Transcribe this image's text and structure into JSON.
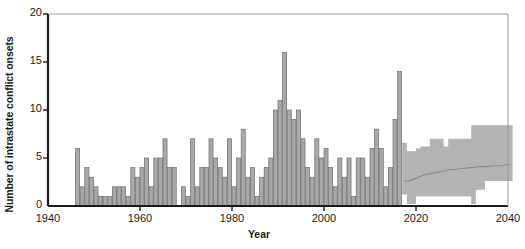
{
  "chart_data": {
    "type": "bar",
    "title": "",
    "xlabel": "Year",
    "ylabel": "Number of intrastate conflict onsets",
    "xlim": [
      1940,
      2040
    ],
    "ylim": [
      0,
      20
    ],
    "xticks": [
      1940,
      1960,
      1980,
      2000,
      2020,
      2040
    ],
    "yticks": [
      0,
      5,
      10,
      15,
      20
    ],
    "grid": false,
    "legend": null,
    "bar_color": "#a8a8a8",
    "bar_edge_color": "#6e6e6e",
    "band_color": "#b3b3b3",
    "median_line_color": "#8a8a8a",
    "axis_color": "#1a1a1a",
    "series": [
      {
        "name": "Observed intrastate conflict onsets",
        "kind": "bar",
        "x": [
          1946,
          1947,
          1948,
          1949,
          1950,
          1951,
          1952,
          1953,
          1954,
          1955,
          1956,
          1957,
          1958,
          1959,
          1960,
          1961,
          1962,
          1963,
          1964,
          1965,
          1966,
          1967,
          1968,
          1969,
          1970,
          1971,
          1972,
          1973,
          1974,
          1975,
          1976,
          1977,
          1978,
          1979,
          1980,
          1981,
          1982,
          1983,
          1984,
          1985,
          1986,
          1987,
          1988,
          1989,
          1990,
          1991,
          1992,
          1993,
          1994,
          1995,
          1996,
          1997,
          1998,
          1999,
          2000,
          2001,
          2002,
          2003,
          2004,
          2005,
          2006,
          2007,
          2008,
          2009,
          2010,
          2011,
          2012,
          2013,
          2014,
          2015,
          2016
        ],
        "values": [
          6,
          2,
          4,
          3,
          2,
          1,
          1,
          1,
          2,
          2,
          2,
          1,
          4,
          3,
          4,
          5,
          2,
          5,
          5,
          7,
          4,
          4,
          0,
          2,
          1,
          7,
          2,
          4,
          4,
          7,
          5,
          4,
          3,
          7,
          2,
          5,
          8,
          3,
          4,
          1,
          3,
          4,
          5,
          10,
          11,
          16,
          10,
          9,
          10,
          7,
          4,
          3,
          7,
          5,
          6,
          4,
          2,
          5,
          3,
          5,
          1,
          5,
          5,
          3,
          6,
          8,
          6,
          2,
          4,
          9,
          14
        ]
      },
      {
        "name": "Forecast median",
        "kind": "line",
        "x": [
          2017,
          2018,
          2019,
          2020,
          2021,
          2022,
          2023,
          2024,
          2025,
          2026,
          2027,
          2028,
          2029,
          2030,
          2031,
          2032,
          2033,
          2034,
          2035,
          2036,
          2037,
          2038,
          2039,
          2040
        ],
        "values": [
          2.6,
          2.6,
          2.8,
          3.0,
          3.2,
          3.3,
          3.4,
          3.5,
          3.6,
          3.7,
          3.8,
          3.8,
          3.9,
          3.9,
          4.0,
          4.0,
          4.1,
          4.1,
          4.1,
          4.2,
          4.2,
          4.2,
          4.3,
          4.3
        ]
      },
      {
        "name": "Forecast uncertainty band",
        "kind": "band",
        "x": [
          2017,
          2018,
          2019,
          2020,
          2021,
          2022,
          2023,
          2024,
          2025,
          2026,
          2027,
          2028,
          2029,
          2030,
          2031,
          2032,
          2033,
          2034,
          2035,
          2036,
          2037,
          2038,
          2039,
          2040
        ],
        "upper": [
          6.6,
          5.7,
          5.7,
          6.0,
          6.2,
          6.2,
          7.0,
          7.0,
          7.0,
          6.2,
          7.0,
          7.0,
          7.0,
          7.0,
          7.0,
          8.4,
          8.4,
          8.4,
          8.4,
          8.4,
          8.4,
          8.4,
          8.4,
          8.4
        ],
        "lower": [
          1.2,
          0.2,
          0.2,
          1.0,
          1.0,
          1.0,
          1.0,
          1.0,
          1.0,
          1.0,
          1.0,
          1.0,
          1.0,
          1.0,
          1.0,
          0.2,
          1.7,
          1.7,
          2.6,
          2.6,
          2.6,
          2.6,
          2.6,
          2.6
        ]
      }
    ]
  }
}
